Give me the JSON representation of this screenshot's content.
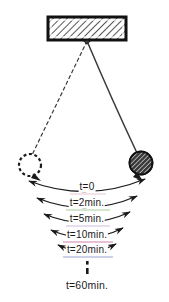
{
  "figure": {
    "background_color": "#ffffff",
    "ink_color": "#1a1a1a",
    "support": {
      "name": "ceiling support block",
      "hatch_color": "#2b2b2b",
      "border_color": "#111111"
    },
    "pivot": {
      "x": 87,
      "y": 41
    },
    "strings": {
      "left": {
        "style": "dashed",
        "label": "displaced position string"
      },
      "right": {
        "style": "solid",
        "label": "bob string"
      }
    },
    "bobs": {
      "left": {
        "style": "dashed-outline",
        "cx": 30,
        "cy": 165,
        "r": 11
      },
      "right": {
        "style": "hatched-filled",
        "cx": 141,
        "cy": 163,
        "r": 11,
        "fill_color": "#3a3a3a"
      }
    },
    "arcs": [
      {
        "label": "t=0",
        "y": 186,
        "half_width": 58,
        "underline_color": "#e4b9c8"
      },
      {
        "label": "t=2min.",
        "y": 203,
        "half_width": 50,
        "underline_color": "#8fbf7a"
      },
      {
        "label": "t=5min.",
        "y": 219,
        "half_width": 43,
        "underline_color": "#c2a6d6"
      },
      {
        "label": "t=10min.",
        "y": 235,
        "half_width": 36,
        "underline_color": "#c05a9a"
      },
      {
        "label": "t=20min.",
        "y": 250,
        "half_width": 29,
        "underline_color": "#7a86c4"
      }
    ],
    "ellipsis": {
      "x": 87,
      "y_top": 260,
      "y_bottom": 275,
      "dots": 2
    },
    "final_label": {
      "text": "t=60min.",
      "x": 87,
      "y": 281
    }
  }
}
